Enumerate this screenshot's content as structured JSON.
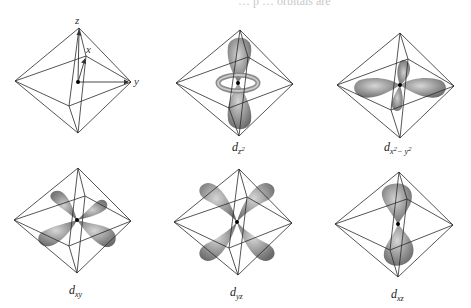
{
  "figure": {
    "type": "d-orbitals-in-octahedral-field",
    "top_cropped_text": "… p … orbitals are",
    "colors": {
      "edge": "#2a2a2a",
      "lobe_dark": "#6e6e6e",
      "lobe_light": "#c8c8c8",
      "nucleus": "#000000",
      "background": "#ffffff"
    },
    "axes_panel": {
      "axes": [
        {
          "name": "z",
          "label": "z"
        },
        {
          "name": "x",
          "label": "x"
        },
        {
          "name": "y",
          "label": "y"
        }
      ]
    },
    "orbitals": [
      {
        "id": "dz2",
        "main": "d",
        "sub": "z",
        "sup": "2",
        "sub2": ""
      },
      {
        "id": "dx2-y2",
        "main": "d",
        "sub": "x",
        "sup": "2",
        "sub2": "− y",
        "sup2": "2"
      },
      {
        "id": "dxy",
        "main": "d",
        "sub": "xy"
      },
      {
        "id": "dyz",
        "main": "d",
        "sub": "yz"
      },
      {
        "id": "dxz",
        "main": "d",
        "sub": "xz"
      }
    ]
  }
}
